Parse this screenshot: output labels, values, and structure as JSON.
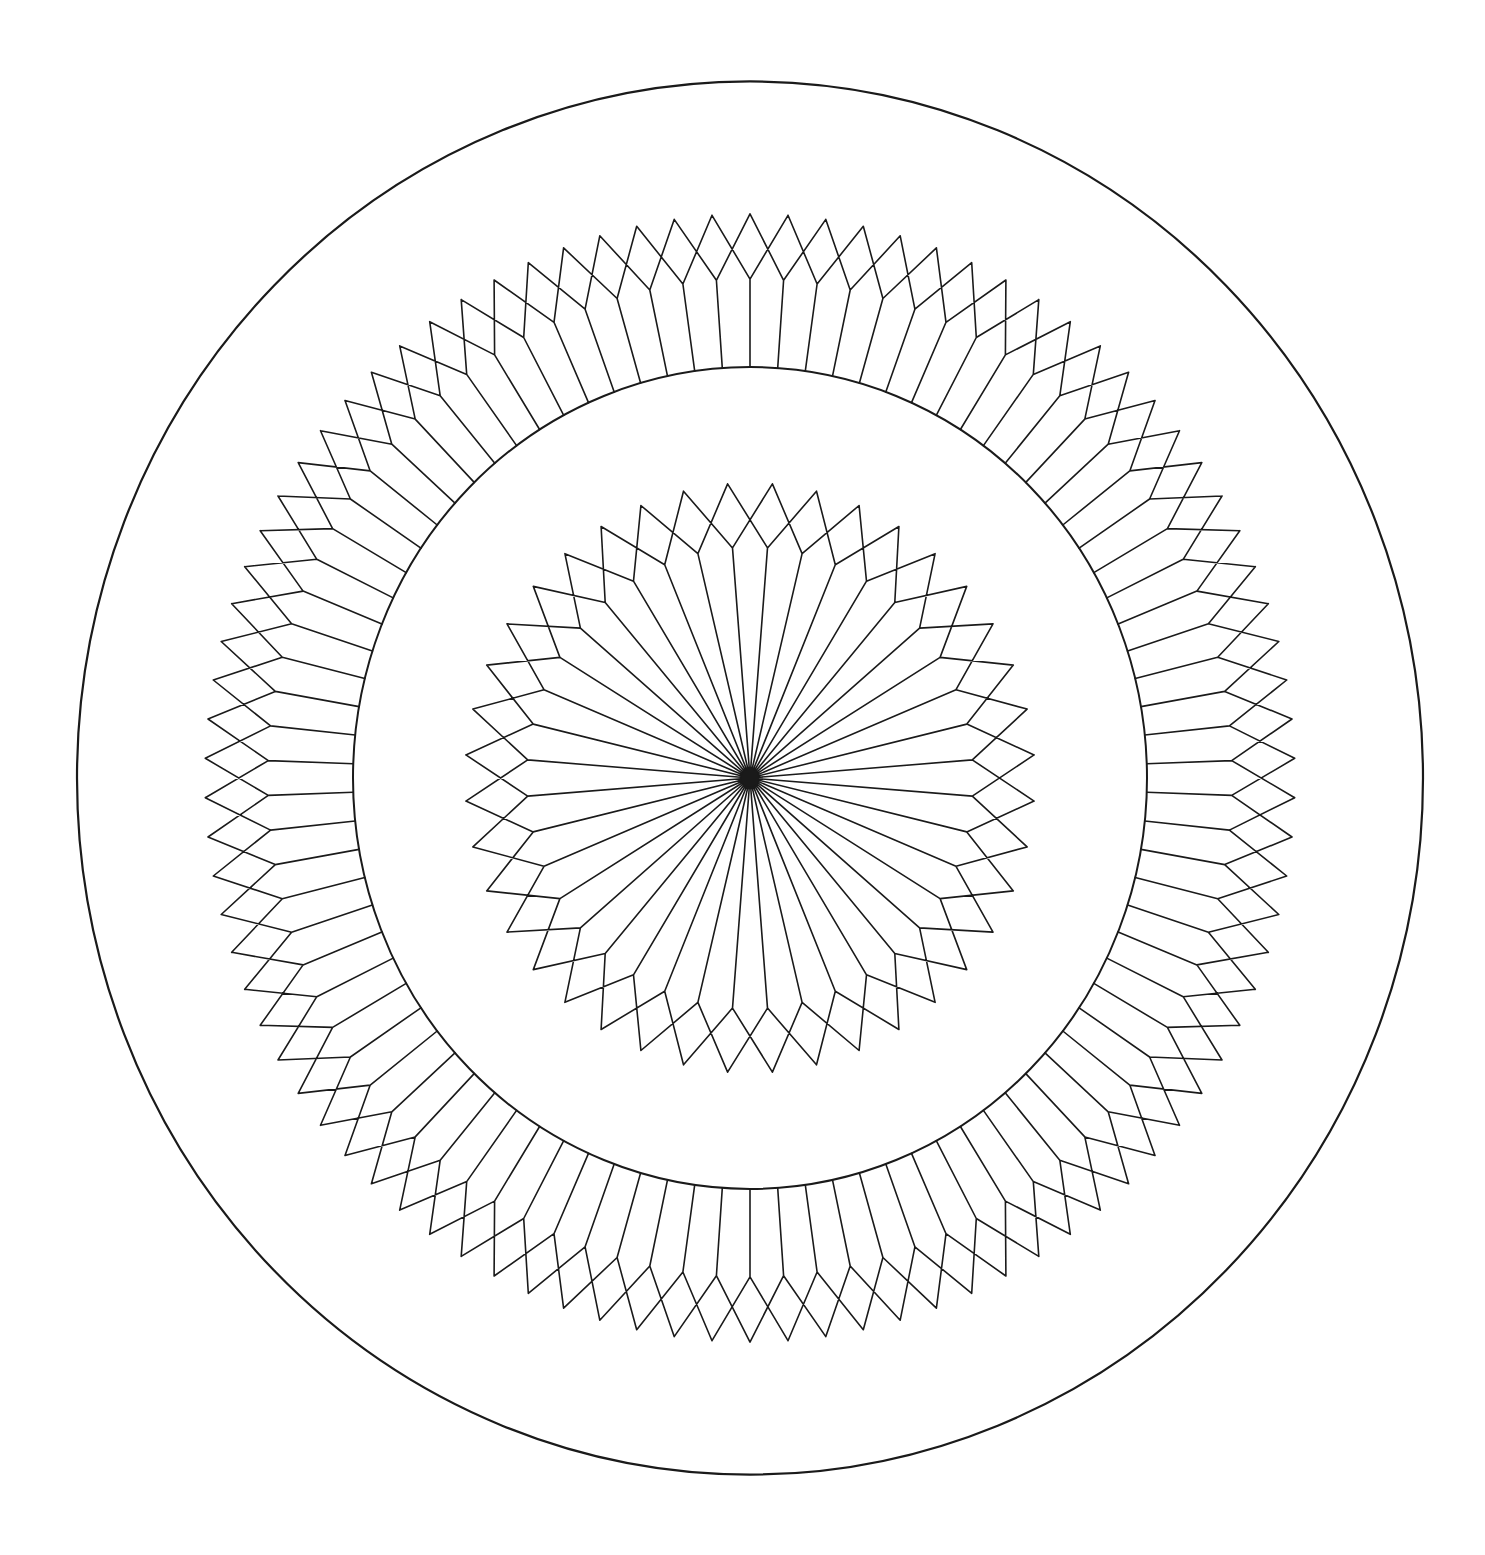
{
  "canvas": {
    "width": 1485,
    "height": 1555,
    "background": "#ffffff"
  },
  "drawing": {
    "title": "",
    "center": {
      "x": 750,
      "y": 778
    },
    "y_scale": 1.035,
    "line_color": "#1a1a1a",
    "outer_circle": {
      "r": 673,
      "stroke_width": 2.2
    },
    "middle_circle": {
      "r": 397,
      "stroke_width": 2
    },
    "outer_ring": {
      "spokes": 90,
      "r_start": 397,
      "r_kink": 482,
      "r_tip": 545,
      "angle_offset_deg": 0,
      "stroke_width": 1.6
    },
    "inner_star": {
      "spokes": 40,
      "r_start": 0,
      "r_kink": 223,
      "r_tip": 285,
      "angle_offset_deg": 4.5,
      "stroke_width": 1.6
    },
    "center_hub": {
      "r": 9
    }
  }
}
